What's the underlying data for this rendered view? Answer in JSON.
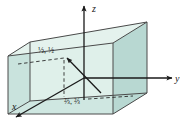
{
  "figure": {
    "type": "3d-coordinate-box-diagram",
    "background": "#ffffff"
  },
  "axes": {
    "z": {
      "label": "z",
      "direction": "up"
    },
    "y": {
      "label": "y",
      "direction": "right"
    },
    "x": {
      "label": "x",
      "direction": "down-left"
    },
    "color": "#1a1a1a"
  },
  "box": {
    "name": "unit-cuboid",
    "faces": {
      "top": "#dff0ea",
      "front_left": "#c9e3dd",
      "front_bottom": "#c9e3dd",
      "right": "#b8d8d2",
      "back": "#dff0ea"
    },
    "edge_color": "#4a4a4a"
  },
  "points": [
    {
      "name": "upper-point",
      "label": "½, ½",
      "description": "point in interior reached by vector arrow"
    },
    {
      "name": "base-point",
      "label": "⅔, ⅔",
      "description": "point on base plane"
    }
  ],
  "vector": {
    "name": "position-vector",
    "style": "solid-arrow",
    "color": "#1a1a1a"
  },
  "projection_lines": {
    "style": "dashed",
    "color": "#2a2a2a"
  },
  "colors": {
    "mint_light": "#dff0ea",
    "mint_mid": "#c9e3dd",
    "teal_dark": "#b8d8d2",
    "ink": "#1a1a1a",
    "edge": "#4a4a4a"
  }
}
